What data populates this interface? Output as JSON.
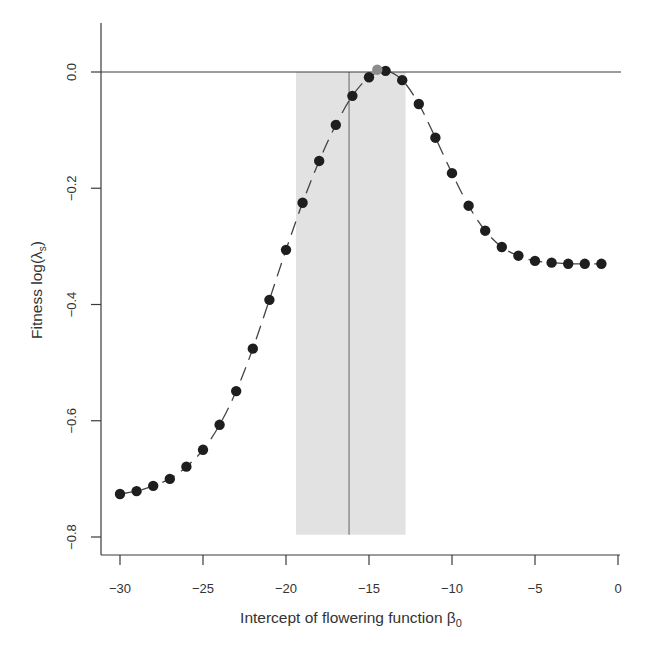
{
  "chart_data": {
    "type": "scatter",
    "title": "",
    "xlabel": "Intercept of flowering function β",
    "xlabel_subscript": "0",
    "ylabel": "Fitness log(λ",
    "ylabel_subscript": "s",
    "ylabel_suffix": ")",
    "xlim": [
      -30,
      0
    ],
    "ylim": [
      -0.8,
      0.0
    ],
    "xticks": [
      -30,
      -25,
      -20,
      -15,
      -10,
      -5,
      0
    ],
    "xtick_labels": [
      "−30",
      "−25",
      "−20",
      "−15",
      "−10",
      "−5",
      "0"
    ],
    "yticks": [
      0.0,
      -0.2,
      -0.4,
      -0.6,
      -0.8
    ],
    "ytick_labels": [
      "0.0",
      "−0.2",
      "−0.4",
      "−0.6",
      "−0.8"
    ],
    "grid": false,
    "reference_hline": 0.0,
    "shaded_interval": {
      "x": [
        -19.4,
        -12.8
      ],
      "y": [
        -0.796,
        0.0
      ],
      "color": "#e2e2e2"
    },
    "vertical_line": {
      "x": -16.2,
      "y": [
        -0.796,
        0.0
      ],
      "color": "#888888"
    },
    "series": [
      {
        "name": "fitness",
        "marker": "circle",
        "color": "#1e1e1e",
        "line_style": "dashed",
        "x": [
          -30,
          -29,
          -28,
          -27,
          -26,
          -25,
          -24,
          -23,
          -22,
          -21,
          -20,
          -19,
          -18,
          -17,
          -16,
          -15,
          -14,
          -13,
          -12,
          -11,
          -10,
          -9,
          -8,
          -7,
          -6,
          -5,
          -4,
          -3,
          -2,
          -1
        ],
        "y": [
          -0.726,
          -0.721,
          -0.712,
          -0.7,
          -0.679,
          -0.65,
          -0.607,
          -0.549,
          -0.476,
          -0.392,
          -0.306,
          -0.225,
          -0.153,
          -0.091,
          -0.041,
          -0.009,
          0.002,
          -0.014,
          -0.055,
          -0.113,
          -0.174,
          -0.23,
          -0.273,
          -0.301,
          -0.316,
          -0.325,
          -0.328,
          -0.33,
          -0.33,
          -0.33
        ]
      },
      {
        "name": "optimum",
        "marker": "circle",
        "color": "#8c8c8c",
        "x": [
          -14.5
        ],
        "y": [
          0.004
        ]
      }
    ]
  }
}
